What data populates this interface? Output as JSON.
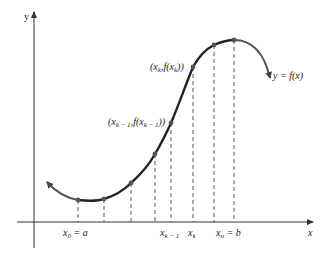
{
  "diagram": {
    "type": "riemann-partition-curve",
    "colors": {
      "axis": "#333333",
      "curve": "#2a2a2a",
      "dashed": "#444444",
      "point": "#555555",
      "text": "#222222"
    },
    "axes": {
      "x_label": "x",
      "y_label": "y"
    },
    "curve_label": "y = f(x)",
    "point_labels": {
      "pk_minus_1": "(x_{k−1}, f(x_{k−1}))",
      "pk_minus_1_parts": {
        "open": "(x",
        "sub1": "k − 1",
        "mid": ",f(x",
        "sub2": "k − 1",
        "close": "))"
      },
      "pk": "(x_k, f(x_k))",
      "pk_parts": {
        "open": "(x",
        "sub1": "k",
        "mid": ",f(x",
        "sub2": "k",
        "close": "))"
      }
    },
    "x_tick_labels": {
      "x0": {
        "base": "x",
        "sub": "0",
        "rest": " = a"
      },
      "xk_minus_1": {
        "base": "x",
        "sub": "k − 1"
      },
      "xk": {
        "base": "x",
        "sub": "k"
      },
      "xn": {
        "base": "x",
        "sub": "n",
        "rest": " = b"
      }
    },
    "partition_points": [
      {
        "x": 78,
        "y": 200
      },
      {
        "x": 104,
        "y": 199
      },
      {
        "x": 131,
        "y": 183
      },
      {
        "x": 155,
        "y": 154
      },
      {
        "x": 171,
        "y": 123
      },
      {
        "x": 193,
        "y": 67
      },
      {
        "x": 214,
        "y": 45
      },
      {
        "x": 234,
        "y": 40
      }
    ]
  }
}
